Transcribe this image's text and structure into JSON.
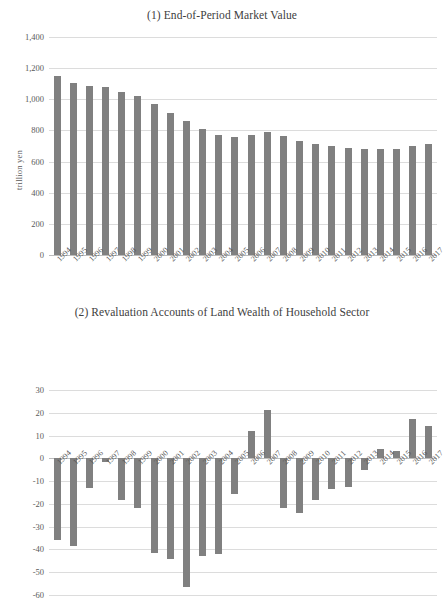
{
  "page": {
    "background": "#ffffff",
    "bar_color": "#808080",
    "grid_color": "#dcdcdc",
    "text_color": "#4a4a4a"
  },
  "charts": [
    {
      "id": "chart-1",
      "title": "(1) End-of-Period Market Value",
      "ylabel": "trillion yen",
      "xlabel": ""
    },
    {
      "id": "chart-2",
      "title": "(2) Revaluation Accounts of Land Wealth of Household Sector",
      "ylabel": "trillion yen",
      "xlabel": ""
    }
  ],
  "chart_data": [
    {
      "type": "bar",
      "title": "(1) End-of-Period Market Value",
      "xlabel": "",
      "ylabel": "trillion yen",
      "ylim": [
        0,
        1400
      ],
      "yticks": [
        0,
        200,
        400,
        600,
        800,
        1000,
        1200,
        1400
      ],
      "ytick_labels": [
        "0",
        "200",
        "400",
        "600",
        "800",
        "1,000",
        "1,200",
        "1,400"
      ],
      "grid": true,
      "legend": "none",
      "categories": [
        "1994",
        "1995",
        "1996",
        "1997",
        "1998",
        "1999",
        "2000",
        "2001",
        "2002",
        "2003",
        "2004",
        "2005",
        "2006",
        "2007",
        "2008",
        "2009",
        "2010",
        "2011",
        "2012",
        "2013",
        "2014",
        "2015",
        "2016",
        "2017"
      ],
      "values": [
        1150,
        1103,
        1085,
        1078,
        1047,
        1020,
        970,
        915,
        860,
        810,
        772,
        757,
        770,
        789,
        764,
        733,
        716,
        697,
        685,
        681,
        682,
        683,
        697,
        710
      ]
    },
    {
      "type": "bar",
      "title": "(2) Revaluation Accounts of Land Wealth of Household Sector",
      "xlabel": "",
      "ylabel": "trillion yen",
      "ylim": [
        -60,
        30
      ],
      "yticks": [
        30,
        20,
        10,
        0,
        -10,
        -20,
        -30,
        -40,
        -50,
        -60
      ],
      "ytick_labels": [
        "30",
        "20",
        "10",
        "0",
        "-10",
        "-20",
        "-30",
        "-40",
        "-50",
        "-60"
      ],
      "grid": true,
      "legend": "none",
      "categories": [
        "1994",
        "1995",
        "1996",
        "1997",
        "1998",
        "1999",
        "2000",
        "2001",
        "2002",
        "2003",
        "2004",
        "2005",
        "2006",
        "2007",
        "2008",
        "2009",
        "2010",
        "2011",
        "2012",
        "2013",
        "2014",
        "2015",
        "2016",
        "2017"
      ],
      "values": [
        -36.0,
        -38.3,
        -13.2,
        -1.8,
        -18.5,
        -21.8,
        -41.4,
        -44.4,
        -56.3,
        -42.8,
        -42.2,
        -15.5,
        12.1,
        21.2,
        -21.7,
        -24.0,
        -18.4,
        -13.5,
        -12.7,
        -5.2,
        4.2,
        3.2,
        17.1,
        14.4
      ]
    }
  ]
}
